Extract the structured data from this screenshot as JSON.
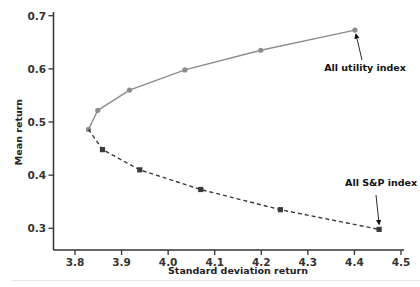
{
  "chart_data": {
    "type": "line",
    "title": "",
    "xlabel": "Standard deviation return",
    "ylabel": "Mean return",
    "xlim": [
      3.75,
      4.5
    ],
    "ylim": [
      0.275,
      0.7
    ],
    "x_ticks": [
      3.8,
      3.9,
      4.0,
      4.1,
      4.2,
      4.3,
      4.4,
      4.5
    ],
    "x_tick_labels": [
      "3.8",
      "3.9",
      "4.0",
      "4.1",
      "4.2",
      "4.3",
      "4.4",
      "4.5"
    ],
    "y_ticks": [
      0.3,
      0.4,
      0.5,
      0.6,
      0.7
    ],
    "y_tick_labels": [
      "0.3",
      "0.4",
      "0.5",
      "0.6",
      "0.7"
    ],
    "grid": false,
    "legend": null,
    "series": [
      {
        "name": "Utility-weighted frontier (upper)",
        "style": "solid",
        "marker": "circle",
        "color": "#8c8c8c",
        "x": [
          3.829,
          3.849,
          3.917,
          4.036,
          4.199,
          4.401
        ],
        "y": [
          0.486,
          0.522,
          0.56,
          0.598,
          0.635,
          0.673
        ]
      },
      {
        "name": "S&P-weighted frontier (lower)",
        "style": "dashed",
        "marker": "square",
        "color": "#3a3a3a",
        "x": [
          3.829,
          3.859,
          3.939,
          4.07,
          4.241,
          4.453
        ],
        "y": [
          0.486,
          0.448,
          0.41,
          0.373,
          0.335,
          0.298
        ]
      }
    ],
    "annotations": [
      {
        "text": "All utility index",
        "point": [
          4.401,
          0.673
        ],
        "text_pos": [
          4.335,
          0.596
        ]
      },
      {
        "text": "All S&P index",
        "point": [
          4.453,
          0.298
        ],
        "text_pos": [
          4.38,
          0.38
        ]
      }
    ]
  }
}
